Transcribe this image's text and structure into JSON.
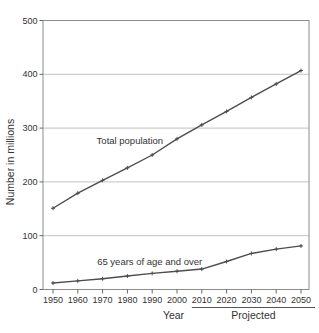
{
  "chart_data": {
    "type": "line",
    "title": "",
    "xlabel": "Year",
    "ylabel": "Number in millions",
    "x": [
      1950,
      1960,
      1970,
      1980,
      1990,
      2000,
      2010,
      2020,
      2030,
      2040,
      2050
    ],
    "series": [
      {
        "name": "Total population",
        "values": [
          151,
          179,
          203,
          226,
          250,
          280,
          306,
          331,
          357,
          382,
          407
        ],
        "label_anchor": {
          "year": 1981,
          "value": 276
        }
      },
      {
        "name": "65 years of age and over",
        "values": [
          12,
          16,
          20,
          25,
          30,
          34,
          38,
          52,
          67,
          75,
          81
        ],
        "label_anchor": {
          "year": 1989,
          "value": 51
        }
      }
    ],
    "ylim": [
      0,
      500
    ],
    "yticks": [
      0,
      100,
      200,
      300,
      400,
      500
    ],
    "grid": true,
    "legend_position": "inline-annotations",
    "projected": {
      "label": "Projected",
      "from_year": 2010,
      "to_year": 2050
    },
    "colors": {
      "line": "#4d4d4d",
      "grid": "#b3b3b3",
      "border": "#8c8c8c",
      "tick": "#666666",
      "text": "#333333",
      "background": "#ffffff"
    }
  }
}
